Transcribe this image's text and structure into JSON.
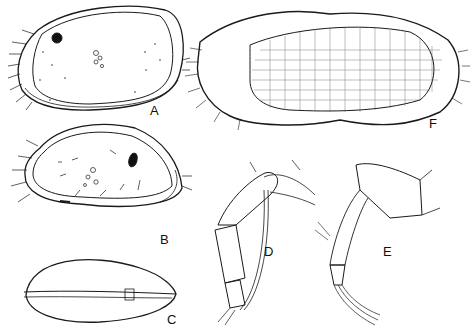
{
  "plate": {
    "background": "#ffffff",
    "ink": "#1a1a1a",
    "panels": [
      {
        "id": "A",
        "label": "A",
        "description": "Carapace, lateral view (left valve), eye spot and muscle scars, marginal setae"
      },
      {
        "id": "B",
        "label": "B",
        "description": "Carapace, lateral view (right valve), eye spot, muscle scars, short surface setae"
      },
      {
        "id": "C",
        "label": "C",
        "description": "Carapace, dorsal view"
      },
      {
        "id": "D",
        "label": "D",
        "description": "Appendage (limb) with segments and setae"
      },
      {
        "id": "E",
        "label": "E",
        "description": "Appendage (limb) with segments and terminal claws"
      },
      {
        "id": "F",
        "label": "F",
        "description": "Carapace, reticulate ornamentation, marginal pore canals and setae"
      }
    ]
  }
}
